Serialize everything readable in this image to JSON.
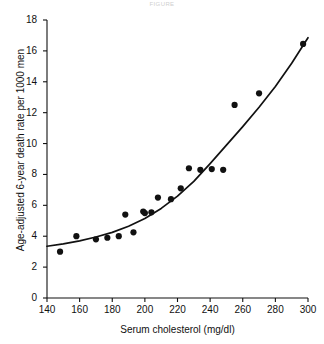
{
  "figure": {
    "faint_header": "FIGURE",
    "background": "#ffffff",
    "ink_color": "#111111"
  },
  "chart_data": {
    "type": "scatter",
    "title": "",
    "xlabel": "Serum cholesterol (mg/dl)",
    "ylabel": "Age-adjusted 6-year death rate per 1000 men",
    "xlim": [
      140,
      300
    ],
    "ylim": [
      0,
      18
    ],
    "xticks": [
      140,
      160,
      180,
      200,
      220,
      240,
      260,
      280,
      300
    ],
    "yticks": [
      0,
      2,
      4,
      6,
      8,
      10,
      12,
      14,
      16,
      18
    ],
    "grid": false,
    "legend": "none",
    "series": [
      {
        "name": "Observed death rate",
        "type": "scatter",
        "marker": "filled-circle",
        "color": "#111111",
        "points": [
          {
            "x": 148,
            "y": 3.0
          },
          {
            "x": 158,
            "y": 4.0
          },
          {
            "x": 170,
            "y": 3.8
          },
          {
            "x": 177,
            "y": 3.9
          },
          {
            "x": 184,
            "y": 4.0
          },
          {
            "x": 188,
            "y": 5.4
          },
          {
            "x": 193,
            "y": 4.25
          },
          {
            "x": 199,
            "y": 5.6
          },
          {
            "x": 200,
            "y": 5.5
          },
          {
            "x": 204,
            "y": 5.55
          },
          {
            "x": 208,
            "y": 6.5
          },
          {
            "x": 216,
            "y": 6.4
          },
          {
            "x": 222,
            "y": 7.1
          },
          {
            "x": 227,
            "y": 8.4
          },
          {
            "x": 234,
            "y": 8.3
          },
          {
            "x": 241,
            "y": 8.35
          },
          {
            "x": 248,
            "y": 8.3
          },
          {
            "x": 255,
            "y": 12.5
          },
          {
            "x": 270,
            "y": 13.25
          },
          {
            "x": 297,
            "y": 16.45
          }
        ]
      },
      {
        "name": "Fitted curve",
        "type": "line",
        "color": "#111111",
        "points": [
          {
            "x": 140,
            "y": 3.35
          },
          {
            "x": 150,
            "y": 3.5
          },
          {
            "x": 160,
            "y": 3.7
          },
          {
            "x": 170,
            "y": 3.95
          },
          {
            "x": 180,
            "y": 4.25
          },
          {
            "x": 190,
            "y": 4.65
          },
          {
            "x": 200,
            "y": 5.15
          },
          {
            "x": 210,
            "y": 5.8
          },
          {
            "x": 220,
            "y": 6.6
          },
          {
            "x": 230,
            "y": 7.55
          },
          {
            "x": 240,
            "y": 8.7
          },
          {
            "x": 250,
            "y": 9.9
          },
          {
            "x": 260,
            "y": 11.1
          },
          {
            "x": 270,
            "y": 12.35
          },
          {
            "x": 280,
            "y": 13.7
          },
          {
            "x": 290,
            "y": 15.2
          },
          {
            "x": 300,
            "y": 16.85
          }
        ]
      }
    ]
  }
}
